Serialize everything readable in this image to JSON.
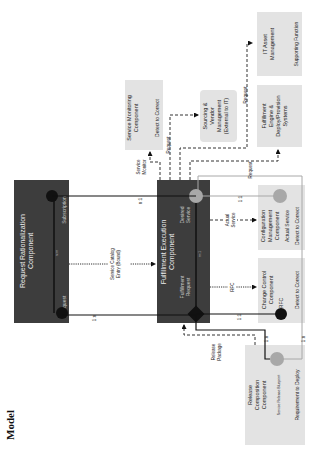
{
  "page": {
    "heading": "Model"
  },
  "components": {
    "request_rationalization": {
      "title_1": "Request Rationalization",
      "title_2": "Component",
      "left": "Request",
      "right": "Subscription",
      "cardinality": "n:m"
    },
    "fulfillment_execution": {
      "title_1": "Fulfillment Execution",
      "title_2": "Component",
      "left_1": "Fulfillment",
      "left_2": "Request",
      "right_1": "Desired",
      "right_2": "Service",
      "cardinality": "m:1"
    },
    "change_control": {
      "title_1": "Change Control",
      "title_2": "Component",
      "item": "RFC",
      "footer": "Detect to Correct"
    },
    "configuration_management": {
      "title_1": "Configuration",
      "title_2": "Management",
      "title_3": "Component",
      "item": "Actual Service",
      "footer": "Detect to Correct"
    },
    "release_composition": {
      "title_1": "Release",
      "title_2": "Composition",
      "title_3": "Component",
      "item": "Service Release Blueprint",
      "footer": "Requirement to Deploy"
    },
    "service_monitoring": {
      "title_1": "Service Monitoring",
      "title_2": "Component",
      "footer": "Detect to Correct"
    },
    "sourcing_vendor": {
      "title_1": "Sourcing &",
      "title_2": "Vendor",
      "title_3": "Management",
      "title_4": "(External to IT)"
    },
    "fulfillment_engine": {
      "title_1": "Fulfillment",
      "title_2": "Engine &",
      "title_3": "Deploy/Provision",
      "title_4": "Systems"
    },
    "it_asset": {
      "title_1": "IT Asset",
      "title_2": "Management",
      "footer": "Supporting Function"
    }
  },
  "connectors": {
    "request_to_fulfillment": "1:n",
    "subscription_to_service": "n:1",
    "service_catalog_1": "Service Catalog",
    "service_catalog_2": "Entry (Bound)",
    "rfc": "RFC",
    "actual_service_1": "Actual",
    "actual_service_2": "Service",
    "fulfillment_to_rfc": "1:1",
    "service_to_config": "1:1",
    "fulfillment_to_release": "1:n",
    "release_to_service": "1:n",
    "release_package_1": "Release",
    "release_package_2": "Package",
    "service_monitor_1": "Service",
    "service_monitor_2": "Monitor",
    "request_sourcing": "Request",
    "request_engine": "Request",
    "request_asset": "Request"
  },
  "colors": {
    "dark_box": "#3d3d3d",
    "light_box": "#e3e3e3",
    "grey_node": "#a8a8a8",
    "line": "#111111"
  }
}
